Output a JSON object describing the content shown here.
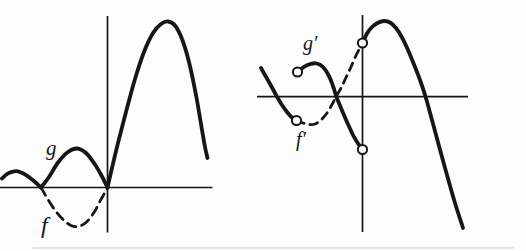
{
  "canvas": {
    "width": 526,
    "height": 251,
    "background": "#fdfdfd",
    "ink": "#161616"
  },
  "figure_description": "Two unlabeled-axis plots: left shows function f (dashed below axis) and g (solid, equal to |f|); right shows derivatives f' (dashed) and g' (solid) with open circles at jump discontinuities on and left of the vertical axis.",
  "chart_data": [
    {
      "name": "left-graph",
      "type": "line",
      "title": "",
      "xlabel": "",
      "ylabel": "",
      "tick_labels": "none",
      "grid": false,
      "coordinate_space": "screen-px (y down)",
      "axes": {
        "x_axis": {
          "x1": 0,
          "x2": 212.5,
          "y": 187.5
        },
        "y_axis": {
          "x": 107.5,
          "y1": 16,
          "y2": 232.5
        }
      },
      "series": [
        {
          "key": "g",
          "label_text": "g",
          "style": "solid",
          "stroke_width": 3.8,
          "segments": [
            [
              [
                2,
                178.5
              ],
              [
                7,
                174
              ],
              [
                12,
                171.8
              ],
              [
                18,
                171.3
              ],
              [
                25,
                174.3
              ],
              [
                33,
                180.3
              ],
              [
                41,
                187.5
              ]
            ],
            [
              [
                41,
                187.5
              ],
              [
                49,
                177
              ],
              [
                58,
                162.5
              ],
              [
                68,
                152
              ],
              [
                77,
                148.5
              ],
              [
                86,
                153
              ],
              [
                95,
                164.5
              ],
              [
                102,
                176.5
              ],
              [
                107.5,
                187.5
              ]
            ],
            [
              [
                107.5,
                187.5
              ],
              [
                112,
                168
              ],
              [
                118,
                143
              ],
              [
                126,
                112
              ],
              [
                135,
                79
              ],
              [
                144,
                52
              ],
              [
                153,
                33
              ],
              [
                161,
                24
              ],
              [
                168,
                21.5
              ],
              [
                175,
                25.5
              ],
              [
                182,
                39
              ],
              [
                189,
                62
              ],
              [
                196,
                95
              ],
              [
                201,
                124
              ],
              [
                205,
                147
              ],
              [
                207.5,
                158
              ]
            ]
          ]
        },
        {
          "key": "f",
          "label_text": "f",
          "style": "dashed",
          "stroke_width": 2.8,
          "dash": "9 6",
          "segments": [
            [
              [
                41,
                187.5
              ],
              [
                48,
                199.5
              ],
              [
                56,
                211.5
              ],
              [
                64,
                220.5
              ],
              [
                71,
                225.5
              ],
              [
                78,
                226.5
              ],
              [
                86,
                222.5
              ],
              [
                94,
                212.5
              ],
              [
                101,
                199.5
              ],
              [
                107.5,
                188
              ]
            ]
          ]
        }
      ],
      "open_points": []
    },
    {
      "name": "right-graph",
      "type": "line",
      "title": "",
      "xlabel": "",
      "ylabel": "",
      "tick_labels": "none",
      "grid": false,
      "coordinate_space": "screen-px (y down)",
      "axes": {
        "x_axis": {
          "x1": 257,
          "x2": 468,
          "y": 96.6
        },
        "y_axis": {
          "x": 362.5,
          "y1": 15,
          "y2": 232
        }
      },
      "series": [
        {
          "key": "g_prime",
          "label_text": "g′",
          "style": "solid",
          "stroke_width": 3.8,
          "segments": [
            [
              [
                261,
                68
              ],
              [
                267,
                78.5
              ],
              [
                272,
                87.5
              ],
              [
                277,
                96.7
              ],
              [
                282,
                105
              ],
              [
                287,
                112
              ],
              [
                291.5,
                117
              ],
              [
                296.5,
                120.5
              ]
            ],
            [
              [
                297.5,
                72
              ],
              [
                304,
                66.8
              ],
              [
                311,
                63.8
              ],
              [
                317,
                63.5
              ],
              [
                323,
                67
              ],
              [
                329,
                76
              ],
              [
                333,
                86
              ],
              [
                336.5,
                97
              ],
              [
                341,
                108
              ],
              [
                347,
                122
              ],
              [
                353,
                135
              ],
              [
                358,
                143.5
              ],
              [
                362.5,
                149.5
              ]
            ],
            [
              [
                362.5,
                43
              ],
              [
                367,
                33.5
              ],
              [
                372,
                27
              ],
              [
                378,
                22.7
              ],
              [
                384,
                21
              ],
              [
                390,
                22.5
              ],
              [
                396,
                28
              ],
              [
                402,
                37.5
              ],
              [
                408,
                50
              ],
              [
                414,
                64.5
              ],
              [
                420,
                80
              ],
              [
                425.5,
                96.5
              ],
              [
                432,
                120
              ],
              [
                439,
                146
              ],
              [
                447,
                175
              ],
              [
                455,
                203
              ],
              [
                463,
                228
              ]
            ]
          ]
        },
        {
          "key": "f_prime",
          "label_text": "f′",
          "style": "dashed",
          "stroke_width": 2.8,
          "dash": "8 6",
          "segments": [
            [
              [
                296.5,
                120.5
              ],
              [
                303,
                123
              ],
              [
                309,
                124.5
              ],
              [
                315,
                124
              ],
              [
                321,
                120
              ],
              [
                327,
                113
              ],
              [
                332,
                104.5
              ],
              [
                336.5,
                96
              ],
              [
                341,
                88
              ],
              [
                346,
                77.5
              ],
              [
                351,
                67
              ],
              [
                356,
                55.5
              ],
              [
                362.5,
                43
              ]
            ]
          ]
        }
      ],
      "open_points": [
        {
          "x": 296.5,
          "y": 120.5
        },
        {
          "x": 297.5,
          "y": 72
        },
        {
          "x": 362.5,
          "y": 43
        },
        {
          "x": 362.5,
          "y": 149.5
        }
      ],
      "open_point_radius": 4.6
    }
  ]
}
